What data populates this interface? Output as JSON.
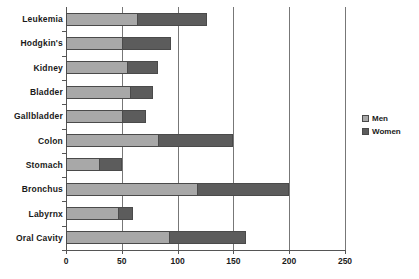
{
  "chart_data": {
    "type": "bar",
    "orientation": "horizontal",
    "stacked": true,
    "title": "",
    "xlabel": "",
    "ylabel": "",
    "xlim": [
      0,
      250
    ],
    "xticks": [
      0,
      50,
      100,
      150,
      200,
      250
    ],
    "grid": true,
    "grid_axis": "x",
    "legend_position": "right",
    "categories": [
      "Leukemia",
      "Hodgkin's",
      "Kidney",
      "Bladder",
      "Gallbladder",
      "Colon",
      "Stomach",
      "Bronchus",
      "Labyrnx",
      "Oral Cavity"
    ],
    "series": [
      {
        "name": "Men",
        "color": "#a8a8a8",
        "values": [
          64,
          50,
          55,
          57,
          50,
          82,
          30,
          117,
          47,
          92
        ]
      },
      {
        "name": "Women",
        "color": "#5c5c5c",
        "values": [
          62,
          44,
          27,
          21,
          22,
          68,
          20,
          83,
          13,
          69
        ]
      }
    ],
    "totals": [
      126,
      94,
      82,
      78,
      72,
      150,
      50,
      200,
      60,
      161
    ]
  },
  "legend": {
    "items": [
      {
        "label": "Men",
        "color": "#a8a8a8",
        "swatch": "legend-swatch-men"
      },
      {
        "label": "Women",
        "color": "#5c5c5c",
        "swatch": "legend-swatch-women"
      }
    ]
  },
  "axis": {
    "x_tick_labels": [
      "0",
      "50",
      "100",
      "150",
      "200",
      "250"
    ]
  }
}
